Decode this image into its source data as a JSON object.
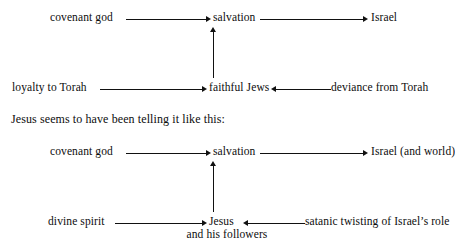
{
  "figure": {
    "caption": "Jesus seems to have been telling it like this:"
  },
  "diagram_top": {
    "name": "traditional-jewish-story-diagram",
    "nodes": {
      "source_upper": "covenant god",
      "middle_upper": "salvation",
      "target_upper": "Israel",
      "source_lower": "loyalty to Torah",
      "middle_lower": "faithful Jews",
      "target_lower": "deviance from Torah"
    },
    "edges": [
      {
        "from": "covenant god",
        "to": "salvation",
        "direction": "right"
      },
      {
        "from": "salvation",
        "to": "Israel",
        "direction": "right"
      },
      {
        "from": "loyalty to Torah",
        "to": "faithful Jews",
        "direction": "right"
      },
      {
        "from": "deviance from Torah",
        "to": "faithful Jews",
        "direction": "left"
      },
      {
        "from": "faithful Jews",
        "to": "salvation",
        "direction": "up"
      }
    ]
  },
  "diagram_bottom": {
    "name": "jesus-story-diagram",
    "nodes": {
      "source_upper": "covenant god",
      "middle_upper": "salvation",
      "target_upper": "Israel (and world)",
      "source_lower": "divine spirit",
      "middle_lower": "Jesus",
      "middle_lower_sub": "and his followers",
      "target_lower": "satanic twisting of Israel’s role"
    },
    "edges": [
      {
        "from": "covenant god",
        "to": "salvation",
        "direction": "right"
      },
      {
        "from": "salvation",
        "to": "Israel (and world)",
        "direction": "right"
      },
      {
        "from": "divine spirit",
        "to": "Jesus",
        "direction": "right"
      },
      {
        "from": "satanic twisting of Israel’s role",
        "to": "Jesus",
        "direction": "left"
      },
      {
        "from": "Jesus",
        "to": "salvation",
        "direction": "up"
      }
    ]
  },
  "style": {
    "ink": "#0d0d0d",
    "line": "#111111",
    "background": "#ffffff"
  }
}
